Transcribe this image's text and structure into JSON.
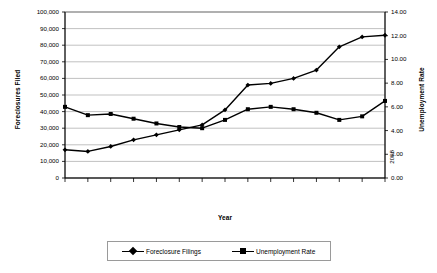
{
  "chart_data": {
    "type": "line",
    "title": "",
    "xlabel": "Year",
    "ylabel": "Foreclosures Filed",
    "ylabel_secondary": "Unemployment Rate",
    "categories": [
      "1994",
      "1995",
      "1996",
      "1997",
      "1998",
      "1999",
      "2000",
      "2001",
      "2002",
      "2003",
      "2004",
      "2005",
      "2006",
      "2007",
      "2008"
    ],
    "ylim": [
      0,
      100000
    ],
    "ylim_secondary": [
      0,
      14
    ],
    "ytick_labels": [
      "0",
      "10,000",
      "20,000",
      "30,000",
      "40,000",
      "50,000",
      "60,000",
      "70,000",
      "80,000",
      "90,000",
      "100,000"
    ],
    "ytick_values": [
      0,
      10000,
      20000,
      30000,
      40000,
      50000,
      60000,
      70000,
      80000,
      90000,
      100000
    ],
    "ytick_labels_secondary": [
      "0.00",
      "2.00",
      "4.00",
      "6.00",
      "8.00",
      "10.00",
      "12.00",
      "14.00"
    ],
    "ytick_values_secondary": [
      0,
      2,
      4,
      6,
      8,
      10,
      12,
      14
    ],
    "grid": true,
    "legend_position": "bottom",
    "series": [
      {
        "name": "Foreclosure Filings",
        "axis": "left",
        "marker": "diamond",
        "color": "#000000",
        "values": [
          17000,
          16000,
          19000,
          23000,
          26000,
          29000,
          32000,
          41000,
          56000,
          57000,
          60000,
          65000,
          79000,
          85000,
          86000
        ]
      },
      {
        "name": "Unemployment Rate",
        "axis": "right",
        "marker": "square",
        "color": "#000000",
        "values": [
          6.0,
          5.3,
          5.4,
          5.0,
          4.6,
          4.3,
          4.2,
          4.9,
          5.8,
          6.0,
          5.8,
          5.5,
          4.9,
          5.2,
          6.5
        ]
      }
    ]
  }
}
